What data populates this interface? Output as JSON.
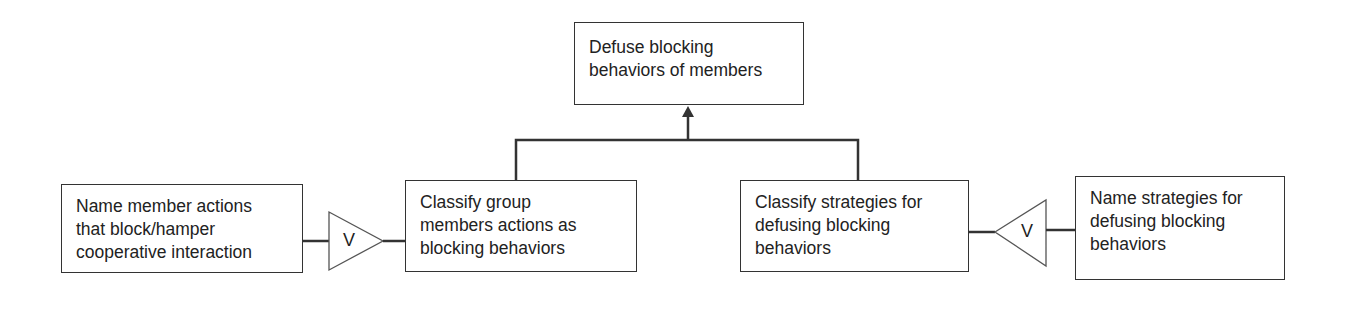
{
  "diagram": {
    "top": {
      "lines": [
        "Defuse blocking",
        "behaviors of members"
      ]
    },
    "left_outer": {
      "lines": [
        "Name member actions",
        "that block/hamper",
        "cooperative interaction"
      ]
    },
    "left_inner": {
      "lines": [
        "Classify group",
        "members  actions as",
        "blocking behaviors"
      ]
    },
    "right_inner": {
      "lines": [
        "Classify strategies for",
        "defusing blocking",
        "behaviors"
      ]
    },
    "right_outer": {
      "lines": [
        "Name strategies for",
        "defusing blocking",
        "behaviors"
      ]
    },
    "left_operator": {
      "symbol": "V",
      "direction": "right"
    },
    "right_operator": {
      "symbol": "V",
      "direction": "left"
    },
    "colors": {
      "stroke": "#333333",
      "text": "#222222",
      "background": "#ffffff"
    }
  }
}
